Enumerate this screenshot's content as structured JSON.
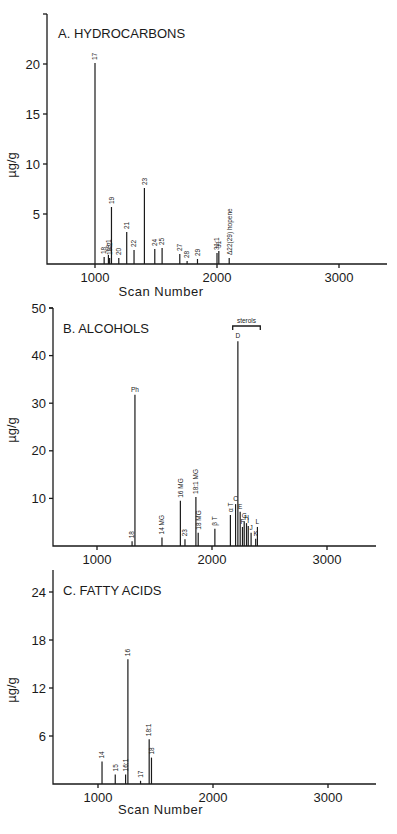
{
  "chart_data": [
    {
      "type": "bar",
      "title": "A. HYDROCARBONS",
      "xlabel": "Scan Number",
      "ylabel": "µg/g",
      "xlim": [
        600,
        3400
      ],
      "ylim": [
        0,
        25
      ],
      "xticks": [
        1000,
        2000,
        3000
      ],
      "yticks": [
        5,
        10,
        15,
        20
      ],
      "peaks": [
        {
          "label": "17",
          "x": 1000,
          "y": 20.1
        },
        {
          "label": "18",
          "x": 1075,
          "y": 0.7
        },
        {
          "label": "19:1",
          "x": 1110,
          "y": 0.9
        },
        {
          "label": "19:2",
          "x": 1120,
          "y": 0.6
        },
        {
          "label": "19",
          "x": 1135,
          "y": 5.7
        },
        {
          "label": "20",
          "x": 1195,
          "y": 0.6
        },
        {
          "label": "21",
          "x": 1260,
          "y": 3.2
        },
        {
          "label": "22",
          "x": 1320,
          "y": 1.4
        },
        {
          "label": "23",
          "x": 1405,
          "y": 7.6
        },
        {
          "label": "24",
          "x": 1490,
          "y": 1.5
        },
        {
          "label": "25",
          "x": 1550,
          "y": 1.6
        },
        {
          "label": "27",
          "x": 1695,
          "y": 1.0
        },
        {
          "label": "28",
          "x": 1755,
          "y": 0.3
        },
        {
          "label": "29",
          "x": 1840,
          "y": 0.5
        },
        {
          "label": "31:1",
          "x": 2000,
          "y": 1.1
        },
        {
          "label": "31",
          "x": 2015,
          "y": 1.3
        },
        {
          "label": "Δ22(29) hopene",
          "x": 2100,
          "y": 0.6
        }
      ]
    },
    {
      "type": "bar",
      "title": "B. ALCOHOLS",
      "xlabel": "",
      "ylabel": "µg/g",
      "xlim": [
        600,
        3400
      ],
      "ylim": [
        0,
        50
      ],
      "xticks": [
        1000,
        2000,
        3000
      ],
      "yticks": [
        10,
        20,
        30,
        40,
        50
      ],
      "annotation": "sterols",
      "peaks": [
        {
          "label": "18",
          "x": 1305,
          "y": 1.0
        },
        {
          "label": "Ph",
          "x": 1330,
          "y": 31.8
        },
        {
          "label": "14 MG",
          "x": 1565,
          "y": 1.8
        },
        {
          "label": "16 MG",
          "x": 1725,
          "y": 9.5
        },
        {
          "label": "23",
          "x": 1765,
          "y": 1.4
        },
        {
          "label": "18:1 MG",
          "x": 1860,
          "y": 10.3
        },
        {
          "label": "18 MG",
          "x": 1880,
          "y": 2.8
        },
        {
          "label": "β T",
          "x": 2025,
          "y": 3.6
        },
        {
          "label": "α T",
          "x": 2160,
          "y": 6.5
        },
        {
          "label": "C",
          "x": 2205,
          "y": 8.8
        },
        {
          "label": "D",
          "x": 2225,
          "y": 43.0
        },
        {
          "label": "E",
          "x": 2245,
          "y": 7.2
        },
        {
          "label": "F",
          "x": 2265,
          "y": 4.0
        },
        {
          "label": "G",
          "x": 2280,
          "y": 5.2
        },
        {
          "label": "H",
          "x": 2300,
          "y": 4.8
        },
        {
          "label": "I",
          "x": 2315,
          "y": 4.2
        },
        {
          "label": "J",
          "x": 2340,
          "y": 2.8
        },
        {
          "label": "K",
          "x": 2380,
          "y": 1.5
        },
        {
          "label": "L",
          "x": 2395,
          "y": 4.0
        }
      ]
    },
    {
      "type": "bar",
      "title": "C. FATTY ACIDS",
      "xlabel": "Scan Number",
      "ylabel": "µg/g",
      "xlim": [
        600,
        3400
      ],
      "ylim": [
        0,
        27
      ],
      "xticks": [
        1000,
        2000,
        3000
      ],
      "yticks": [
        6,
        12,
        18,
        24
      ],
      "peaks": [
        {
          "label": "14",
          "x": 1035,
          "y": 2.8
        },
        {
          "label": "15",
          "x": 1150,
          "y": 1.2
        },
        {
          "label": "16:1",
          "x": 1240,
          "y": 1.2
        },
        {
          "label": "16",
          "x": 1260,
          "y": 15.6
        },
        {
          "label": "17",
          "x": 1370,
          "y": 0.4
        },
        {
          "label": "18:1",
          "x": 1445,
          "y": 5.6
        },
        {
          "label": "18",
          "x": 1465,
          "y": 3.3
        }
      ]
    }
  ],
  "panels": {
    "a": {
      "title": "A. HYDROCARBONS",
      "xlabel": "Scan Number",
      "ylabel": "µg/g"
    },
    "b": {
      "title": "B. ALCOHOLS",
      "ylabel": "µg/g",
      "annotation": "sterols"
    },
    "c": {
      "title": "C. FATTY ACIDS",
      "xlabel": "Scan Number",
      "ylabel": "µg/g"
    }
  }
}
